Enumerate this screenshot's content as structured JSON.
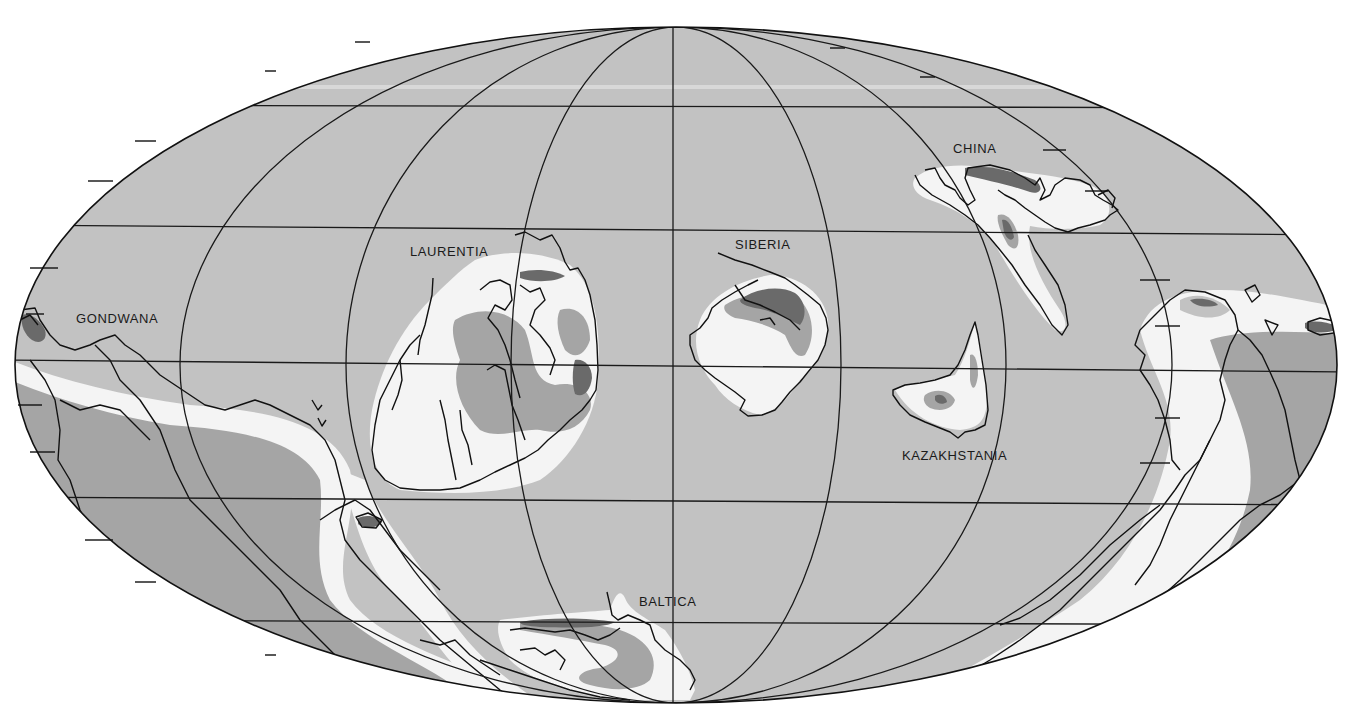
{
  "map": {
    "projection": "Mollweide (elliptical equal-area)",
    "colors": {
      "ocean": "#c2c2c2",
      "shelf": "#f4f4f4",
      "lowland": "#a5a5a5",
      "upland": "#6a6a6a",
      "outline": "#111111",
      "background": "#ffffff"
    },
    "labels": {
      "gondwana": "GONDWANA",
      "laurentia": "LAURENTIA",
      "siberia": "SIBERIA",
      "china": "CHINA",
      "kazakhstania": "KAZAKHSTANIA",
      "baltica": "BALTICA"
    },
    "continents": [
      {
        "name": "GONDWANA"
      },
      {
        "name": "LAURENTIA"
      },
      {
        "name": "SIBERIA"
      },
      {
        "name": "CHINA"
      },
      {
        "name": "KAZAKHSTANIA"
      },
      {
        "name": "BALTICA"
      }
    ]
  }
}
